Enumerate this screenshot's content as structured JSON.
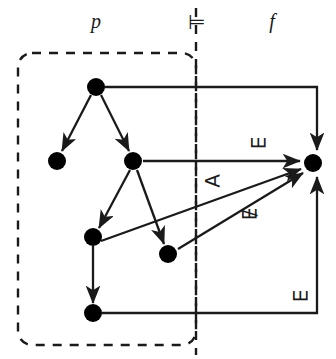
{
  "figure": {
    "width": 336,
    "height": 359,
    "background": "#ffffff",
    "stroke_color": "#1a1a1a",
    "node_fill": "#000000"
  },
  "headers": [
    {
      "id": "p",
      "text": "p",
      "x": 96,
      "y": 22,
      "italic": true
    },
    {
      "id": "models",
      "text": "⊨",
      "x": 196,
      "y": 22,
      "italic": false
    },
    {
      "id": "f",
      "text": "f",
      "x": 272,
      "y": 22,
      "italic": true
    }
  ],
  "region_box": {
    "name": "p-region",
    "x": 18,
    "y": 53,
    "width": 178,
    "height": 292,
    "corner_radius": 14,
    "stroke_dash": "9 8",
    "stroke_width": 2.4
  },
  "separator": {
    "name": "models-separator",
    "x": 196,
    "y_top": 8,
    "y_bottom": 355,
    "stroke_dash": "9 8",
    "stroke_width": 2.4
  },
  "nodes": [
    {
      "id": "n1",
      "label": "root",
      "x": 96,
      "y": 87,
      "r": 9
    },
    {
      "id": "n2",
      "label": "left-child",
      "x": 57,
      "y": 161,
      "r": 9
    },
    {
      "id": "n3",
      "label": "right-child",
      "x": 133,
      "y": 161,
      "r": 9
    },
    {
      "id": "n4",
      "label": "lower-left",
      "x": 93,
      "y": 237,
      "r": 9
    },
    {
      "id": "n5",
      "label": "lower-right",
      "x": 168,
      "y": 254,
      "r": 9
    },
    {
      "id": "n6",
      "label": "bottom",
      "x": 93,
      "y": 313,
      "r": 9
    },
    {
      "id": "n7",
      "label": "f-node",
      "x": 313,
      "y": 163,
      "r": 9
    }
  ],
  "tree_edges": [
    {
      "id": "e1",
      "from": "n1",
      "to": "n2",
      "arrow": true
    },
    {
      "id": "e2",
      "from": "n1",
      "to": "n3",
      "arrow": true
    },
    {
      "id": "e3",
      "from": "n3",
      "to": "n4",
      "arrow": true
    },
    {
      "id": "e4",
      "from": "n3",
      "to": "n5",
      "arrow": true
    },
    {
      "id": "e5",
      "from": "n4",
      "to": "n6",
      "arrow": true
    }
  ],
  "cross_edges": [
    {
      "id": "c1",
      "name": "root-to-f-top",
      "from": "n1",
      "to": "n7",
      "kind": "orthogonal-top",
      "label": null,
      "points": "105,87 317,87 317,150",
      "arrow": true
    },
    {
      "id": "c2",
      "name": "exists-edge",
      "from": "n3",
      "to": "n7",
      "kind": "straight",
      "label": "∃",
      "label_x": 258,
      "label_y": 142,
      "points": "143,161 301,161",
      "arrow": true
    },
    {
      "id": "c3",
      "name": "forall-edge",
      "from": "n4",
      "to": "n7",
      "kind": "straight",
      "label": "∀",
      "label_x": 212,
      "label_y": 181,
      "points": "102,240 302,168",
      "arrow": true
    },
    {
      "id": "c4",
      "name": "not-exists-edge",
      "from": "n5",
      "to": "n7",
      "kind": "straight",
      "label": "∄",
      "label_x": 249,
      "label_y": 213,
      "points": "178,249 304,172",
      "arrow": true
    },
    {
      "id": "c5",
      "name": "bottom-to-f",
      "from": "n6",
      "to": "n7",
      "kind": "orthogonal-bottom",
      "label": "∃",
      "label_x": 300,
      "label_y": 295,
      "points": "102,313 317,313 317,176",
      "arrow": true
    }
  ]
}
